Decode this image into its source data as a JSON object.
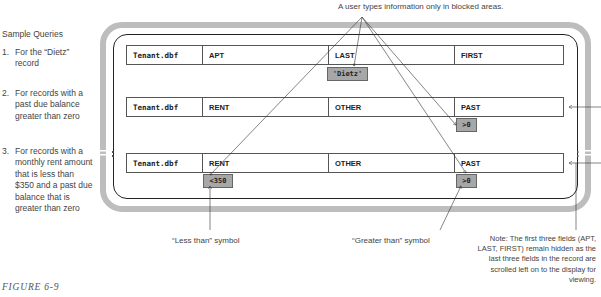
{
  "sidebar": {
    "title": "Sample Queries",
    "queries": [
      {
        "number": "1.",
        "text": "For the “Dietz” record"
      },
      {
        "number": "2.",
        "text": "For records with a past due balance greater than zero"
      },
      {
        "number": "3.",
        "text": "For records with a monthly rent amount that is less than $350 and a past due balance that is greater than zero"
      }
    ]
  },
  "figure_label": "FIGURE 6-9",
  "top_caption": "A user types information only in blocked areas.",
  "rows": [
    {
      "table": "Tenant.dbf",
      "fields": [
        "APT",
        "LAST",
        "FIRST"
      ]
    },
    {
      "table": "Tenant.dbf",
      "fields": [
        "RENT",
        "OTHER",
        "PAST"
      ]
    },
    {
      "table": "Tenant.dbf",
      "fields": [
        "RENT",
        "OTHER",
        "PAST"
      ]
    }
  ],
  "criteria": {
    "dietz": "'Dietz'",
    "past_row2": ">0",
    "rent_row3": "<350",
    "past_row3": ">0"
  },
  "labels": {
    "less_than": "“Less than” symbol",
    "greater_than": "“Greater than” symbol"
  },
  "note": "Note:  The first three fields (APT, LAST, FIRST) remain hidden as the last three fields in the record are scrolled left on to the display for viewing.",
  "colors": {
    "frame_outer": "#bdbdbd",
    "badge_fill": "#a7a7a7",
    "line": "#333333"
  }
}
